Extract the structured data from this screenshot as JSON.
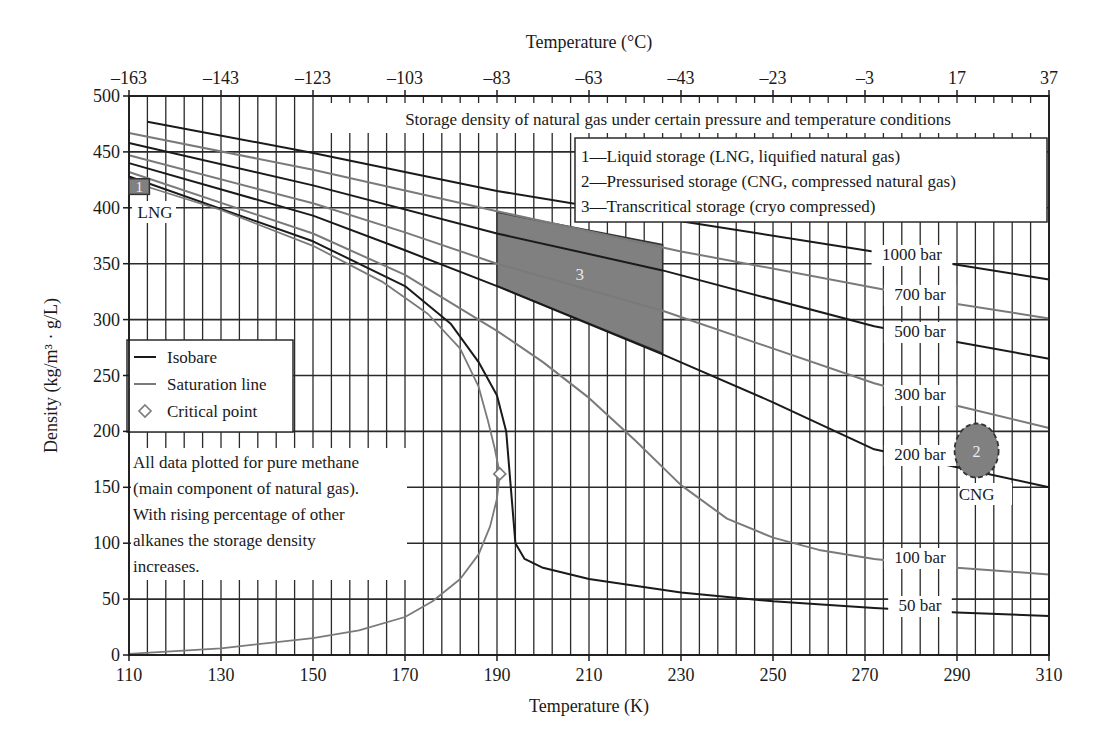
{
  "chart_data": {
    "type": "line",
    "title": "Storage density of natural gas under certain pressure and temperature conditions",
    "xlabel": "Temperature (K)",
    "x2label": "Temperature (°C)",
    "ylabel": "Density (kg/m³ · g/L)",
    "xlim": [
      110,
      310
    ],
    "ylim": [
      0,
      500
    ],
    "x_ticks": [
      110,
      130,
      150,
      170,
      190,
      210,
      230,
      250,
      270,
      290,
      310
    ],
    "x_tick_labels": [
      "110",
      "130",
      "150",
      "170",
      "190",
      "210",
      "230",
      "250",
      "270",
      "290",
      "310"
    ],
    "x2_tick_labels": [
      "–163",
      "–143",
      "–123",
      "–103",
      "–83",
      "–63",
      "–43",
      "–23",
      "–3",
      "17",
      "37"
    ],
    "y_ticks": [
      0,
      50,
      100,
      150,
      200,
      250,
      300,
      350,
      400,
      450,
      500
    ],
    "y_tick_labels": [
      "0",
      "50",
      "100",
      "150",
      "200",
      "250",
      "300",
      "350",
      "400",
      "450",
      "500"
    ],
    "grid": {
      "x_minor_step": 4,
      "y_step": 50,
      "on": true
    },
    "series": [
      {
        "name": "1000 bar",
        "kind": "isobar",
        "color": "#1a1a1a",
        "label": "1000 bar",
        "points": [
          [
            114,
            477
          ],
          [
            150,
            449
          ],
          [
            190,
            415
          ],
          [
            230,
            388
          ],
          [
            270,
            362
          ],
          [
            290,
            349
          ],
          [
            310,
            336
          ]
        ]
      },
      {
        "name": "700 bar",
        "kind": "isobar",
        "color": "#7a7a7a",
        "label": "700 bar",
        "points": [
          [
            110,
            467
          ],
          [
            150,
            434
          ],
          [
            190,
            397
          ],
          [
            230,
            361
          ],
          [
            274,
            327
          ],
          [
            290,
            314
          ],
          [
            310,
            301
          ]
        ]
      },
      {
        "name": "500 bar",
        "kind": "isobar",
        "color": "#1a1a1a",
        "label": "500 bar",
        "points": [
          [
            110,
            458
          ],
          [
            150,
            420
          ],
          [
            190,
            377
          ],
          [
            226,
            344
          ],
          [
            272,
            294
          ],
          [
            290,
            280
          ],
          [
            310,
            265
          ]
        ]
      },
      {
        "name": "300 bar",
        "kind": "isobar",
        "color": "#7a7a7a",
        "label": "300 bar",
        "points": [
          [
            110,
            447
          ],
          [
            150,
            404
          ],
          [
            170,
            378
          ],
          [
            190,
            350
          ],
          [
            226,
            308
          ],
          [
            272,
            243
          ],
          [
            290,
            223
          ],
          [
            310,
            203
          ]
        ]
      },
      {
        "name": "200 bar",
        "kind": "isobar",
        "color": "#1a1a1a",
        "label": "200 bar",
        "points": [
          [
            110,
            440
          ],
          [
            150,
            393
          ],
          [
            170,
            362
          ],
          [
            190,
            330
          ],
          [
            226,
            269
          ],
          [
            250,
            226
          ],
          [
            272,
            184
          ],
          [
            290,
            168
          ],
          [
            310,
            150
          ]
        ]
      },
      {
        "name": "100 bar",
        "kind": "isobar",
        "color": "#7a7a7a",
        "label": "100 bar",
        "points": [
          [
            110,
            432
          ],
          [
            150,
            377
          ],
          [
            170,
            340
          ],
          [
            190,
            290
          ],
          [
            200,
            262
          ],
          [
            210,
            230
          ],
          [
            220,
            192
          ],
          [
            230,
            152
          ],
          [
            240,
            122
          ],
          [
            250,
            105
          ],
          [
            260,
            94
          ],
          [
            272,
            86
          ],
          [
            290,
            78
          ],
          [
            310,
            72
          ]
        ]
      },
      {
        "name": "50 bar",
        "kind": "isobar",
        "color": "#1a1a1a",
        "label": "50 bar",
        "points": [
          [
            110,
            428
          ],
          [
            150,
            370
          ],
          [
            170,
            330
          ],
          [
            180,
            296
          ],
          [
            186,
            262
          ],
          [
            190,
            232
          ],
          [
            192,
            200
          ],
          [
            193,
            150
          ],
          [
            194,
            100
          ],
          [
            196,
            86
          ],
          [
            200,
            78
          ],
          [
            210,
            68
          ],
          [
            230,
            56
          ],
          [
            250,
            48
          ],
          [
            272,
            42
          ],
          [
            290,
            38
          ],
          [
            310,
            35
          ]
        ]
      },
      {
        "name": "Saturation line (liquid)",
        "kind": "saturation",
        "color": "#7a7a7a",
        "points": [
          [
            110,
            424
          ],
          [
            130,
            398
          ],
          [
            150,
            366
          ],
          [
            165,
            334
          ],
          [
            175,
            305
          ],
          [
            182,
            274
          ],
          [
            186,
            240
          ],
          [
            188,
            210
          ],
          [
            189.5,
            185
          ],
          [
            190.6,
            162
          ]
        ]
      },
      {
        "name": "Saturation line (vapor)",
        "kind": "saturation",
        "color": "#7a7a7a",
        "points": [
          [
            110,
            1
          ],
          [
            130,
            6
          ],
          [
            150,
            15
          ],
          [
            160,
            22
          ],
          [
            170,
            34
          ],
          [
            176,
            48
          ],
          [
            182,
            68
          ],
          [
            186,
            90
          ],
          [
            188.5,
            115
          ],
          [
            190,
            140
          ],
          [
            190.6,
            162
          ]
        ]
      }
    ],
    "critical_point": {
      "x": 190.6,
      "y": 162,
      "marker": "diamond"
    },
    "regions": [
      {
        "id": "1",
        "label": "LNG",
        "shape": "square",
        "x": [
          110,
          114
        ],
        "y": [
          412,
          426
        ],
        "fill": "#808080"
      },
      {
        "id": "2",
        "label": "CNG",
        "shape": "ellipse-dashed",
        "cx": 296,
        "cy": 182,
        "rx": 3,
        "ry": 24,
        "fill": "#808080"
      },
      {
        "id": "3",
        "label": "",
        "shape": "polygon",
        "points": [
          [
            190,
            396
          ],
          [
            226,
            367
          ],
          [
            226,
            270
          ],
          [
            190,
            330
          ]
        ],
        "fill": "#808080"
      }
    ],
    "legend": {
      "position": "left-middle",
      "entries": [
        {
          "label": "Isobare",
          "style": "line",
          "color": "#1a1a1a"
        },
        {
          "label": "Saturation line",
          "style": "line",
          "color": "#7a7a7a"
        },
        {
          "label": "Critical point",
          "style": "diamond",
          "color": "#7a7a7a"
        }
      ]
    },
    "annotations": {
      "storage_types": [
        "1—Liquid storage (LNG, liquified natural gas)",
        "2—Pressurised storage (CNG, compressed natural gas)",
        "3—Transcritical storage (cryo compressed)"
      ],
      "note": [
        "All data plotted for pure methane",
        "(main component of natural gas).",
        "With rising percentage of other",
        "alkanes the storage density",
        "increases."
      ]
    }
  }
}
